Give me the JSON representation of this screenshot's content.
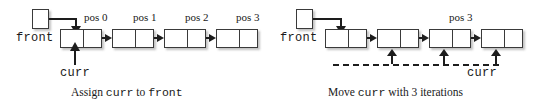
{
  "figure": {
    "panels": [
      {
        "id": "left",
        "caption_parts": {
          "before": "Assign ",
          "mono1": "curr",
          "middle": " to ",
          "mono2": "front"
        },
        "caption_text": "Assign curr to front",
        "front_label": "front",
        "curr_label": "curr",
        "pos_labels": [
          "pos 0",
          "pos 1",
          "pos 2",
          "pos 3"
        ],
        "node_count": 4,
        "curr_target_index": 0
      },
      {
        "id": "right",
        "caption_parts": {
          "before": "Move ",
          "mono1": "curr",
          "middle": " with 3 iterations",
          "mono2": ""
        },
        "caption_text": "Move curr with 3 iterations",
        "front_label": "front",
        "curr_label": "curr",
        "pos_labels": [
          "pos 3"
        ],
        "node_count": 4,
        "curr_target_index": 3,
        "iterations": 3
      }
    ],
    "colors": {
      "ink": "#1d1d1d",
      "stroke": "#3a3a3a",
      "fill": "#ffffff",
      "shadow": "rgba(120,120,120,0.45)",
      "background": "#ffffff"
    }
  }
}
